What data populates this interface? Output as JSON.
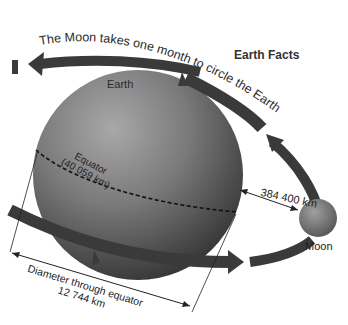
{
  "diagram": {
    "title": "Earth Facts",
    "orbit_caption": "The Moon takes one month to circle the Earth",
    "earth_label": "Earth",
    "moon_label": "Moon",
    "equator_label": "Equator",
    "equator_length": "(40 059 km)",
    "earth_moon_distance": "384 400 km",
    "diameter_label": "Diameter through equator",
    "diameter_value": "12 744 km"
  },
  "colors": {
    "background": "#ffffff",
    "arrow": "#3a3a3a",
    "earth_light": "#9a9a9a",
    "earth_dark": "#3c3c3c",
    "moon": "#8a8a8a",
    "text": "#2a2a2a"
  }
}
